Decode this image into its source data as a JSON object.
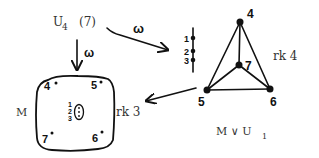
{
  "top_label": {
    "base": "U",
    "sub": "4",
    "suffix": "(7)"
  },
  "arrow_right_label": "ω",
  "arrow_down_label": "ω",
  "stack": {
    "labels": [
      "1",
      "2",
      "3"
    ]
  },
  "tetra": {
    "vertex_labels": {
      "top": "4",
      "center": "7",
      "left": "5",
      "right": "6"
    },
    "rank_label": "rk 4",
    "caption": {
      "prefix": "M ∨ U",
      "sub": "1"
    }
  },
  "box": {
    "name_label": "M",
    "rank_label": "rk 3",
    "corner_labels": {
      "top_left": "4",
      "top_right": "5",
      "bottom_left": "7",
      "bottom_right": "6"
    },
    "inner_labels": [
      "1",
      "2",
      "3"
    ]
  }
}
